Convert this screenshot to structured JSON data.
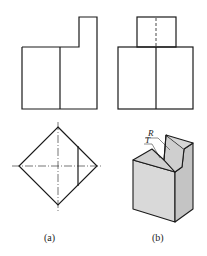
{
  "figure": {
    "views": [
      {
        "id": "a",
        "caption": "(a)",
        "description": "front view, top view with centerlines"
      },
      {
        "id": "b",
        "caption": "(b)",
        "description": "side view and isometric block"
      }
    ],
    "annotations": {
      "surface_r": "R",
      "surface_t": "T"
    },
    "colors": {
      "line": "#1a1a1a",
      "face_light": "#d9d9d9",
      "face_mid": "#cfcfcf",
      "face_dark": "#c4c4c4"
    }
  }
}
